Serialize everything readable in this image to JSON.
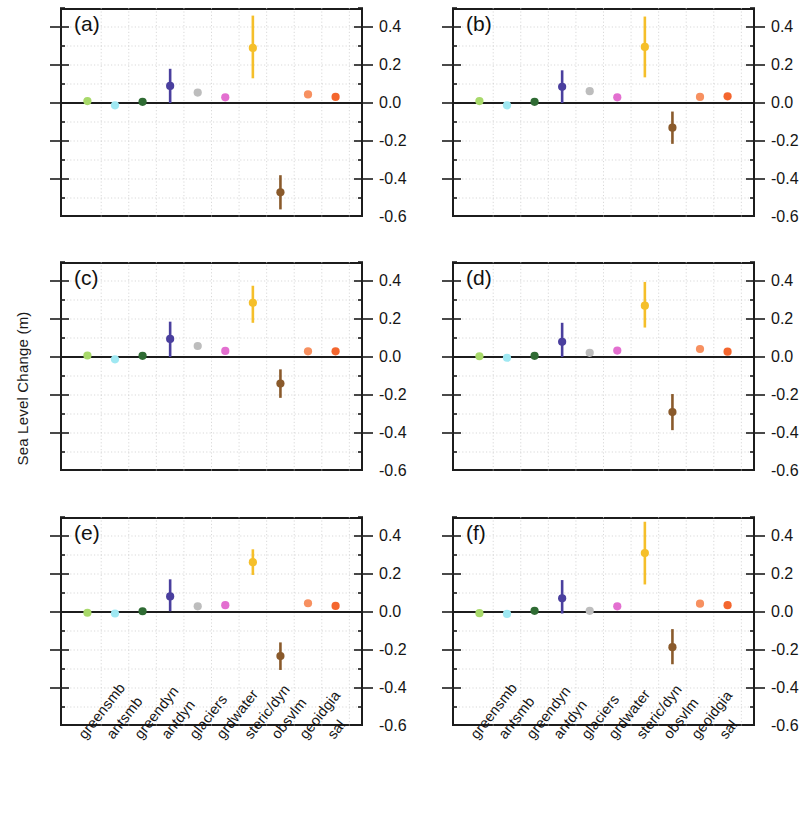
{
  "figure": {
    "ylabel": "Sea Level Change (m)",
    "panel_labels": [
      "(a)",
      "(b)",
      "(c)",
      "(d)",
      "(e)",
      "(f)"
    ]
  },
  "chart_data": {
    "type": "scatter",
    "title": "",
    "xlabel": "",
    "ylabel": "Sea Level Change (m)",
    "ylim": [
      -0.6,
      0.5
    ],
    "ytick_labels": [
      "0.4",
      "0.2",
      "0.0",
      "-0.2",
      "-0.4",
      "-0.6"
    ],
    "ytick_values": [
      0.4,
      0.2,
      0.0,
      -0.2,
      -0.4,
      -0.6
    ],
    "yminor_step": 0.1,
    "grid": true,
    "legend": "none",
    "error_bars": "vertical",
    "categories": [
      "greensmb",
      "antsmb",
      "greendyn",
      "antdyn",
      "glaciers",
      "grdwater",
      "steric/dyn",
      "obsvlm",
      "geoidgia",
      "sal"
    ],
    "category_colors": {
      "greensmb": "#a8d96a",
      "antsmb": "#9fe8f2",
      "greendyn": "#2f6b33",
      "antdyn": "#4a3f9e",
      "glaciers": "#bdbdbd",
      "grdwater": "#e36fd0",
      "steric/dyn": "#f5bf2a",
      "obsvlm": "#8a5a2b",
      "geoidgia": "#f79060",
      "sal": "#f4662e"
    },
    "panels": [
      {
        "label": "(a)",
        "points": [
          {
            "category": "greensmb",
            "value": 0.01,
            "low": 0.01,
            "high": 0.01
          },
          {
            "category": "antsmb",
            "value": -0.012,
            "low": -0.018,
            "high": -0.006
          },
          {
            "category": "greendyn",
            "value": 0.006,
            "low": 0.006,
            "high": 0.006
          },
          {
            "category": "antdyn",
            "value": 0.09,
            "low": 0.0,
            "high": 0.18
          },
          {
            "category": "glaciers",
            "value": 0.055,
            "low": 0.04,
            "high": 0.07
          },
          {
            "category": "grdwater",
            "value": 0.03,
            "low": 0.015,
            "high": 0.045
          },
          {
            "category": "steric/dyn",
            "value": 0.29,
            "low": 0.13,
            "high": 0.46
          },
          {
            "category": "obsvlm",
            "value": -0.47,
            "low": -0.56,
            "high": -0.38
          },
          {
            "category": "geoidgia",
            "value": 0.045,
            "low": 0.045,
            "high": 0.045
          },
          {
            "category": "sal",
            "value": 0.032,
            "low": 0.032,
            "high": 0.032
          }
        ]
      },
      {
        "label": "(b)",
        "points": [
          {
            "category": "greensmb",
            "value": 0.01,
            "low": 0.01,
            "high": 0.01
          },
          {
            "category": "antsmb",
            "value": -0.012,
            "low": -0.018,
            "high": -0.006
          },
          {
            "category": "greendyn",
            "value": 0.006,
            "low": 0.006,
            "high": 0.006
          },
          {
            "category": "antdyn",
            "value": 0.085,
            "low": 0.0,
            "high": 0.172
          },
          {
            "category": "glaciers",
            "value": 0.062,
            "low": 0.048,
            "high": 0.076
          },
          {
            "category": "grdwater",
            "value": 0.03,
            "low": 0.015,
            "high": 0.046
          },
          {
            "category": "steric/dyn",
            "value": 0.295,
            "low": 0.135,
            "high": 0.455
          },
          {
            "category": "obsvlm",
            "value": -0.13,
            "low": -0.215,
            "high": -0.045
          },
          {
            "category": "geoidgia",
            "value": 0.032,
            "low": 0.032,
            "high": 0.032
          },
          {
            "category": "sal",
            "value": 0.035,
            "low": 0.035,
            "high": 0.035
          }
        ]
      },
      {
        "label": "(c)",
        "points": [
          {
            "category": "greensmb",
            "value": 0.008,
            "low": 0.008,
            "high": 0.008
          },
          {
            "category": "antsmb",
            "value": -0.012,
            "low": -0.018,
            "high": -0.006
          },
          {
            "category": "greendyn",
            "value": 0.006,
            "low": 0.006,
            "high": 0.006
          },
          {
            "category": "antdyn",
            "value": 0.095,
            "low": 0.0,
            "high": 0.186
          },
          {
            "category": "glaciers",
            "value": 0.058,
            "low": 0.044,
            "high": 0.072
          },
          {
            "category": "grdwater",
            "value": 0.032,
            "low": 0.018,
            "high": 0.046
          },
          {
            "category": "steric/dyn",
            "value": 0.285,
            "low": 0.18,
            "high": 0.375
          },
          {
            "category": "obsvlm",
            "value": -0.14,
            "low": -0.215,
            "high": -0.065
          },
          {
            "category": "geoidgia",
            "value": 0.03,
            "low": 0.03,
            "high": 0.03
          },
          {
            "category": "sal",
            "value": 0.03,
            "low": 0.03,
            "high": 0.03
          }
        ]
      },
      {
        "label": "(d)",
        "points": [
          {
            "category": "greensmb",
            "value": 0.004,
            "low": 0.004,
            "high": 0.004
          },
          {
            "category": "antsmb",
            "value": -0.004,
            "low": -0.01,
            "high": 0.002
          },
          {
            "category": "greendyn",
            "value": 0.006,
            "low": 0.006,
            "high": 0.006
          },
          {
            "category": "antdyn",
            "value": 0.08,
            "low": 0.0,
            "high": 0.18
          },
          {
            "category": "glaciers",
            "value": 0.022,
            "low": 0.012,
            "high": 0.032
          },
          {
            "category": "grdwater",
            "value": 0.034,
            "low": 0.018,
            "high": 0.05
          },
          {
            "category": "steric/dyn",
            "value": 0.27,
            "low": 0.155,
            "high": 0.395
          },
          {
            "category": "obsvlm",
            "value": -0.29,
            "low": -0.385,
            "high": -0.195
          },
          {
            "category": "geoidgia",
            "value": 0.042,
            "low": 0.042,
            "high": 0.042
          },
          {
            "category": "sal",
            "value": 0.028,
            "low": 0.028,
            "high": 0.028
          }
        ]
      },
      {
        "label": "(e)",
        "points": [
          {
            "category": "greensmb",
            "value": -0.004,
            "low": -0.004,
            "high": -0.004
          },
          {
            "category": "antsmb",
            "value": -0.008,
            "low": -0.014,
            "high": -0.002
          },
          {
            "category": "greendyn",
            "value": 0.004,
            "low": 0.004,
            "high": 0.004
          },
          {
            "category": "antdyn",
            "value": 0.082,
            "low": 0.004,
            "high": 0.172
          },
          {
            "category": "glaciers",
            "value": 0.03,
            "low": 0.02,
            "high": 0.04
          },
          {
            "category": "grdwater",
            "value": 0.036,
            "low": 0.022,
            "high": 0.052
          },
          {
            "category": "steric/dyn",
            "value": 0.262,
            "low": 0.195,
            "high": 0.33
          },
          {
            "category": "obsvlm",
            "value": -0.232,
            "low": -0.305,
            "high": -0.16
          },
          {
            "category": "geoidgia",
            "value": 0.046,
            "low": 0.046,
            "high": 0.046
          },
          {
            "category": "sal",
            "value": 0.032,
            "low": 0.032,
            "high": 0.032
          }
        ]
      },
      {
        "label": "(f)",
        "points": [
          {
            "category": "greensmb",
            "value": -0.006,
            "low": -0.006,
            "high": -0.006
          },
          {
            "category": "antsmb",
            "value": -0.01,
            "low": -0.016,
            "high": -0.004
          },
          {
            "category": "greendyn",
            "value": 0.006,
            "low": 0.006,
            "high": 0.006
          },
          {
            "category": "antdyn",
            "value": 0.072,
            "low": -0.008,
            "high": 0.168
          },
          {
            "category": "glaciers",
            "value": 0.006,
            "low": 0.002,
            "high": 0.01
          },
          {
            "category": "grdwater",
            "value": 0.03,
            "low": 0.018,
            "high": 0.044
          },
          {
            "category": "steric/dyn",
            "value": 0.31,
            "low": 0.145,
            "high": 0.475
          },
          {
            "category": "obsvlm",
            "value": -0.185,
            "low": -0.275,
            "high": -0.09
          },
          {
            "category": "geoidgia",
            "value": 0.044,
            "low": 0.044,
            "high": 0.044
          },
          {
            "category": "sal",
            "value": 0.036,
            "low": 0.036,
            "high": 0.036
          }
        ]
      }
    ]
  }
}
